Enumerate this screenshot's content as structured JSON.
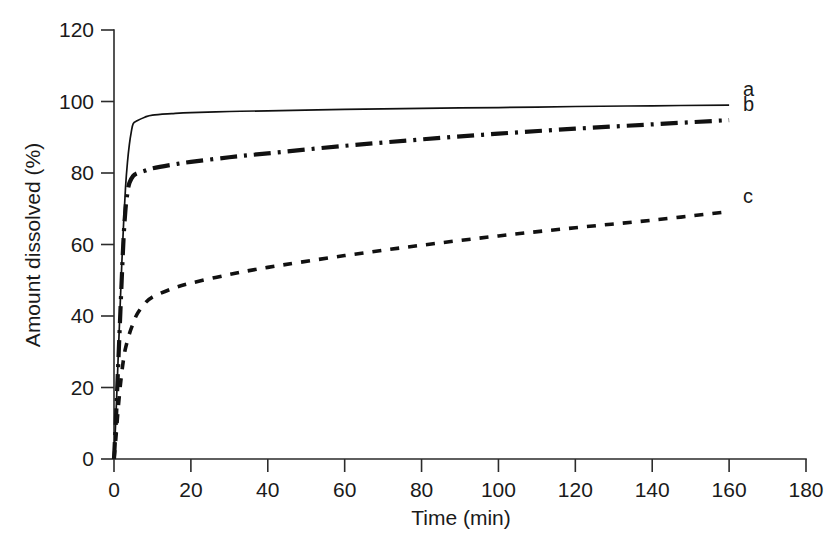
{
  "chart_data": {
    "type": "line",
    "title": "",
    "xlabel": "Time (min)",
    "ylabel": "Amount dissolved (%)",
    "xlim": [
      0,
      180
    ],
    "ylim": [
      0,
      120
    ],
    "xticks": [
      0,
      20,
      40,
      60,
      80,
      100,
      120,
      140,
      160,
      180
    ],
    "yticks": [
      0,
      20,
      40,
      60,
      80,
      100,
      120
    ],
    "xtick_labels": [
      "0",
      "20",
      "40",
      "60",
      "80",
      "100",
      "120",
      "140",
      "160",
      "180"
    ],
    "ytick_labels": [
      "0",
      "20",
      "40",
      "60",
      "80",
      "100",
      "120"
    ],
    "grid": false,
    "legend_position": "right-inline",
    "series": [
      {
        "name": "a",
        "label": "a",
        "style": "solid",
        "color": "#111111",
        "x": [
          0,
          0.5,
          1,
          1.5,
          2,
          2.5,
          3,
          3.5,
          4,
          4.5,
          5,
          6,
          8,
          10,
          15,
          20,
          30,
          40,
          60,
          80,
          100,
          120,
          140,
          160
        ],
        "y": [
          0,
          12,
          26,
          40,
          54,
          66,
          76,
          83,
          88,
          91.5,
          93.8,
          94.6,
          95.6,
          96.2,
          96.6,
          96.9,
          97.2,
          97.4,
          97.8,
          98.1,
          98.3,
          98.6,
          98.8,
          99.0
        ]
      },
      {
        "name": "b",
        "label": "b",
        "style": "dash-dot",
        "color": "#111111",
        "x": [
          0,
          0.5,
          1,
          1.5,
          2,
          2.5,
          3,
          3.5,
          4,
          5,
          6,
          8,
          10,
          15,
          20,
          30,
          40,
          60,
          80,
          100,
          120,
          140,
          160
        ],
        "y": [
          0,
          11,
          24,
          37,
          50,
          62,
          70,
          74.5,
          77.2,
          79.2,
          79.9,
          80.6,
          81.3,
          82.3,
          83.1,
          84.4,
          85.5,
          87.6,
          89.4,
          91.0,
          92.4,
          93.6,
          94.8
        ]
      },
      {
        "name": "c",
        "label": "c",
        "style": "dotted",
        "color": "#111111",
        "x": [
          0,
          0.5,
          1,
          1.5,
          2,
          2.5,
          3,
          4,
          5,
          6,
          8,
          10,
          15,
          20,
          30,
          40,
          60,
          80,
          100,
          120,
          140,
          160
        ],
        "y": [
          0,
          6,
          13,
          19,
          24,
          28,
          31,
          35,
          38,
          40.5,
          43.5,
          45.3,
          47.6,
          49.2,
          51.6,
          53.6,
          56.9,
          59.8,
          62.4,
          64.7,
          66.8,
          69.2
        ]
      }
    ]
  },
  "axes": {
    "x_title": "Time (min)",
    "y_title": "Amount dissolved (%)"
  },
  "series_labels": {
    "a": "a",
    "b": "b",
    "c": "c"
  }
}
